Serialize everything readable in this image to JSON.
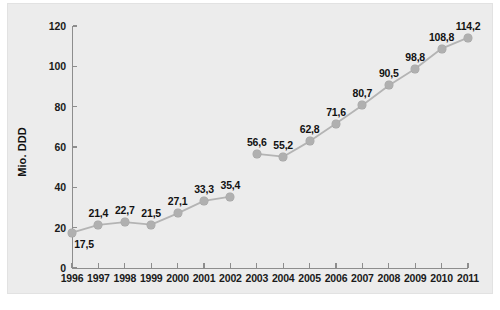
{
  "chart_data": {
    "type": "line",
    "title": "",
    "xlabel": "",
    "ylabel": "Mio. DDD",
    "categories": [
      "1996",
      "1997",
      "1998",
      "1999",
      "2000",
      "2001",
      "2002",
      "2003",
      "2004",
      "2005",
      "2006",
      "2007",
      "2008",
      "2009",
      "2010",
      "2011"
    ],
    "values": [
      17.5,
      21.4,
      22.7,
      21.5,
      27.1,
      33.3,
      35.4,
      56.6,
      55.2,
      62.8,
      71.6,
      80.7,
      90.5,
      98.8,
      108.8,
      114.2
    ],
    "point_labels": [
      "17,5",
      "21,4",
      "22,7",
      "21,5",
      "27,1",
      "33,3",
      "35,4",
      "56,6",
      "55,2",
      "62,8",
      "71,6",
      "80,7",
      "90,5",
      "98,8",
      "108,8",
      "114,2"
    ],
    "ylim": [
      0,
      120
    ],
    "yticks": [
      0,
      20,
      40,
      60,
      80,
      100,
      120
    ],
    "ytick_labels": [
      "0",
      "20",
      "40",
      "60",
      "80",
      "100",
      "120"
    ],
    "grid": false,
    "legend": null,
    "series_breaks": [
      [
        0,
        6
      ],
      [
        7,
        15
      ]
    ],
    "line_color": "#b4b4b4",
    "marker_color": "#b0b0b0",
    "axis_color": "#8d8d8d",
    "label_color": "#121212",
    "panel_background": "#ececec",
    "label_offsets": [
      "below-right",
      "above",
      "above",
      "above",
      "above",
      "above",
      "above",
      "above",
      "above",
      "above",
      "above",
      "above",
      "above",
      "above",
      "above",
      "above"
    ]
  }
}
